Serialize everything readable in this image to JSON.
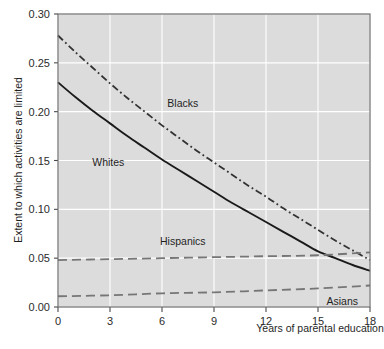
{
  "chart_data": {
    "type": "line",
    "title": "",
    "xlabel": "Years of parental education",
    "ylabel": "Extent to which activities are limited",
    "xlim": [
      0,
      18
    ],
    "ylim": [
      0.0,
      0.3
    ],
    "xticks": [
      "0",
      "3",
      "6",
      "9",
      "12",
      "15",
      "18"
    ],
    "xtick_values": [
      0,
      3,
      6,
      9,
      12,
      15,
      18
    ],
    "yticks": [
      "0.00",
      "0.05",
      "0.10",
      "0.15",
      "0.20",
      "0.25",
      "0.30"
    ],
    "ytick_values": [
      0.0,
      0.05,
      0.1,
      0.15,
      0.2,
      0.25,
      0.3
    ],
    "grid": true,
    "legend_position": "inline-annotations",
    "plot_background": "#dcdcdc",
    "grid_color": "#ffffff",
    "frame_color": "#6e6e6e",
    "series": [
      {
        "name": "Blacks",
        "style": "dash-dot",
        "color": "#333333",
        "label_x": 7.2,
        "label_y": 0.209,
        "x": [
          0,
          1,
          2,
          3,
          4,
          5,
          6,
          7,
          8,
          9,
          10,
          11,
          12,
          13,
          14,
          15,
          16,
          17,
          18
        ],
        "values": [
          0.278,
          0.261,
          0.245,
          0.229,
          0.214,
          0.2,
          0.186,
          0.173,
          0.16,
          0.148,
          0.136,
          0.124,
          0.113,
          0.101,
          0.09,
          0.079,
          0.068,
          0.058,
          0.048
        ]
      },
      {
        "name": "Whites",
        "style": "solid",
        "color": "#1a1a1a",
        "label_x": 2.9,
        "label_y": 0.148,
        "x": [
          0,
          1,
          2,
          3,
          4,
          5,
          6,
          7,
          8,
          9,
          10,
          11,
          12,
          13,
          14,
          15,
          16,
          17,
          18
        ],
        "values": [
          0.23,
          0.215,
          0.201,
          0.188,
          0.175,
          0.163,
          0.151,
          0.14,
          0.129,
          0.118,
          0.107,
          0.097,
          0.087,
          0.077,
          0.067,
          0.057,
          0.05,
          0.043,
          0.037
        ]
      },
      {
        "name": "Hispanics",
        "style": "dashed",
        "color": "#767676",
        "label_x": 7.2,
        "label_y": 0.068,
        "x": [
          0,
          3,
          6,
          9,
          12,
          15,
          18
        ],
        "values": [
          0.048,
          0.049,
          0.05,
          0.051,
          0.052,
          0.053,
          0.056
        ]
      },
      {
        "name": "Asians",
        "style": "dashed",
        "color": "#767676",
        "label_x": 16.4,
        "label_y": 0.006,
        "x": [
          0,
          3,
          6,
          9,
          12,
          15,
          18
        ],
        "values": [
          0.011,
          0.012,
          0.014,
          0.015,
          0.017,
          0.019,
          0.022
        ]
      }
    ]
  },
  "axes": {
    "y_label": "Extent to which activities are limited",
    "x_label": "Years of parental education",
    "y_tick_labels": [
      "0.30",
      "0.25",
      "0.20",
      "0.15",
      "0.10",
      "0.05",
      "0.00"
    ],
    "x_tick_labels": [
      "0",
      "3",
      "6",
      "9",
      "12",
      "15",
      "18"
    ]
  },
  "annotations": {
    "blacks": "Blacks",
    "whites": "Whites",
    "hispanics": "Hispanics",
    "asians": "Asians"
  }
}
